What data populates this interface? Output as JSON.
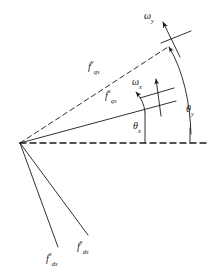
{
  "figure": {
    "name": "rotor-flux-vector-diagram",
    "background_color": "#ffffff",
    "stroke_color": "#1a1a1a",
    "width": 221,
    "height": 277
  },
  "origin": {
    "x": 20,
    "y": 143
  },
  "axes": {
    "horizontal_reference": {
      "label": "",
      "style": "dashed",
      "x1": 20,
      "y1": 143,
      "x2": 209,
      "y2": 143
    }
  },
  "vectors": [
    {
      "id": "f-qs-y",
      "base": "f",
      "superscript": "y",
      "subscript": "qs",
      "style": "dashed",
      "x1": 20,
      "y1": 143,
      "x2": 168,
      "y2": 47,
      "label_x": 88,
      "label_y": 62
    },
    {
      "id": "f-qs-x",
      "base": "f",
      "superscript": "x",
      "subscript": "qs",
      "style": "solid",
      "x1": 20,
      "y1": 143,
      "x2": 175,
      "y2": 101,
      "label_x": 104,
      "label_y": 91
    },
    {
      "id": "f-ds-x",
      "base": "f",
      "superscript": "x",
      "subscript": "ds",
      "style": "solid",
      "x1": 20,
      "y1": 143,
      "x2": 58,
      "y2": 246,
      "label_x": 47,
      "label_y": 250
    },
    {
      "id": "f-ds-y",
      "base": "f",
      "superscript": "y",
      "subscript": "ds",
      "style": "solid",
      "x1": 20,
      "y1": 143,
      "x2": 87,
      "y2": 235,
      "label_x": 77,
      "label_y": 238
    }
  ],
  "angular_velocities": [
    {
      "id": "omega-y",
      "base": "ω",
      "subscript": "y",
      "label_x": 146,
      "label_y": 8
    },
    {
      "id": "omega-x",
      "base": "ω",
      "subscript": "x",
      "label_x": 133,
      "label_y": 74
    }
  ],
  "angles": [
    {
      "id": "theta-y",
      "base": "θ",
      "subscript": "y",
      "label_x": 186,
      "label_y": 101
    },
    {
      "id": "theta-x",
      "base": "θ",
      "subscript": "x",
      "label_x": 134,
      "label_y": 117
    }
  ]
}
